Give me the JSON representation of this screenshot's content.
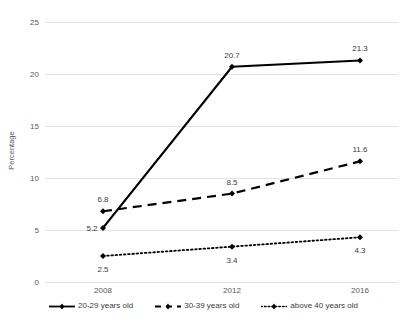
{
  "chart_data": {
    "type": "line",
    "title": "",
    "xlabel": "",
    "ylabel": "Percentage",
    "x": [
      "2008",
      "2012",
      "2016"
    ],
    "categories": [
      "2008",
      "2012",
      "2016"
    ],
    "ylim": [
      0,
      25
    ],
    "yticks": [
      0,
      5,
      10,
      15,
      20,
      25
    ],
    "ytick_labels": [
      "0",
      "5",
      "10",
      "15",
      "20",
      "25"
    ],
    "grid": true,
    "legend_position": "bottom",
    "series": [
      {
        "name": "20-29 years old",
        "values": [
          5.2,
          20.7,
          21.3
        ],
        "labels": [
          "5.2",
          "20.7",
          "21.3"
        ],
        "style": "solid",
        "color": "#000000"
      },
      {
        "name": "30-39 years old",
        "values": [
          6.8,
          8.5,
          11.6
        ],
        "labels": [
          "6.8",
          "8.5",
          "11.6"
        ],
        "style": "dashed",
        "color": "#000000"
      },
      {
        "name": "above 40 years old",
        "values": [
          2.5,
          3.4,
          4.3
        ],
        "labels": [
          "2.5",
          "3.4",
          "4.3"
        ],
        "style": "dotted",
        "color": "#000000"
      }
    ]
  },
  "axis": {
    "y_title": "Percentage",
    "y_ticks": [
      "25",
      "20",
      "15",
      "10",
      "5",
      "0"
    ],
    "x_ticks": [
      "2008",
      "2012",
      "2016"
    ]
  },
  "legend": {
    "items": [
      {
        "label": "20-29 years old"
      },
      {
        "label": "30-39 years old"
      },
      {
        "label": "above 40 years old"
      }
    ]
  },
  "colors": {
    "series": "#000000",
    "grid": "#e2e2e2",
    "tick_text": "#59595b",
    "value_text": "#3b3b3b"
  }
}
